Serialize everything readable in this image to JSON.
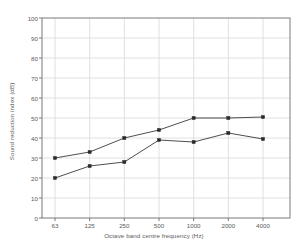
{
  "chart_data": {
    "type": "line",
    "title": "",
    "xlabel": "Octave band centre frequency (Hz)",
    "ylabel": "Sound reduction index (dB)",
    "categories": [
      "63",
      "125",
      "250",
      "500",
      "1000",
      "2000",
      "4000"
    ],
    "xtick_labels": [
      "63",
      "125",
      "250",
      "500",
      "1000",
      "2000",
      "4000"
    ],
    "ytick_labels": [
      "0",
      "10",
      "20",
      "30",
      "40",
      "50",
      "60",
      "70",
      "80",
      "90",
      "100"
    ],
    "ytick_values": [
      0,
      10,
      20,
      30,
      40,
      50,
      60,
      70,
      80,
      90,
      100
    ],
    "ylim": [
      0,
      100
    ],
    "grid": true,
    "legend": "none",
    "series": [
      {
        "name": "upper-curve",
        "values": [
          30,
          33,
          40,
          44,
          50,
          50,
          50.5
        ],
        "color": "#3a3a3a",
        "marker": "square"
      },
      {
        "name": "lower-curve",
        "values": [
          20,
          26,
          28,
          39,
          38,
          42.5,
          39.5
        ],
        "color": "#3a3a3a",
        "marker": "square"
      }
    ],
    "colors": {
      "axis": "#7a7a7a",
      "grid": "#d8d8d8",
      "line": "#4a4a4a",
      "marker": "#2a2a2a",
      "background": "#ffffff",
      "text": "#5a5a5a"
    }
  }
}
